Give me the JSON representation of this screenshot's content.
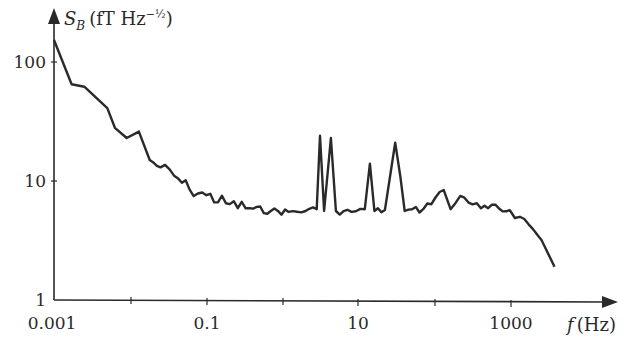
{
  "chart_data": {
    "type": "line",
    "title": "",
    "xlabel": "f (Hz)",
    "ylabel": "S_B (fT Hz^-1/2)",
    "xscale": "log",
    "yscale": "log",
    "xlim": [
      0.001,
      5000
    ],
    "ylim": [
      1,
      200
    ],
    "x_ticks": [
      0.001,
      0.01,
      0.1,
      1,
      10,
      100,
      1000
    ],
    "x_tick_labels": [
      "0.001",
      "",
      "0.1",
      "",
      "10",
      "",
      "1000"
    ],
    "y_ticks": [
      1,
      10,
      100
    ],
    "y_tick_labels": [
      "1",
      "10",
      "100"
    ],
    "grid": false,
    "legend": null,
    "series": [
      {
        "name": "S_B",
        "color": "#2a2a2a",
        "x": [
          0.001,
          0.0017,
          0.0025,
          0.005,
          0.0063,
          0.009,
          0.013,
          0.018,
          0.025,
          0.038,
          0.06,
          0.1,
          0.18,
          0.37,
          0.7,
          1.2,
          2.0,
          2.8,
          3.1,
          3.5,
          4.3,
          5.0,
          8.0,
          12,
          14,
          16,
          22,
          30,
          35,
          40,
          70,
          130,
          160,
          215,
          400,
          960,
          1300,
          1700,
          2500,
          3700
        ],
        "values": [
          153,
          65,
          62,
          41,
          28,
          23,
          26,
          15,
          13,
          11,
          8.5,
          7.6,
          6.5,
          5.9,
          5.6,
          5.5,
          5.6,
          5.8,
          24,
          5.6,
          23,
          5.6,
          5.5,
          5.8,
          14,
          5.6,
          5.7,
          21,
          11,
          5.6,
          5.8,
          8.4,
          5.8,
          7.5,
          5.9,
          5.7,
          5.0,
          4.3,
          3.2,
          1.9
        ]
      }
    ],
    "annotations": []
  },
  "labels": {
    "y_axis_title_main": "S",
    "y_axis_title_sub": "B",
    "y_axis_title_unit": "(fT Hz",
    "y_axis_title_exp": "−½",
    "y_axis_title_close": ")",
    "x_axis_title_var": "f",
    "x_axis_title_unit": "(Hz)",
    "y_tick_100": "100",
    "y_tick_10": "10",
    "y_tick_1": "1",
    "x_tick_0001": "0.001",
    "x_tick_01": "0.1",
    "x_tick_10": "10",
    "x_tick_1000": "1000"
  }
}
